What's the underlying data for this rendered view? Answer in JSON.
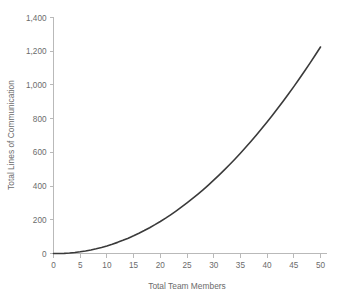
{
  "chart_data": {
    "type": "line",
    "title": "",
    "subtitle": "",
    "xlabel": "Total Team Members",
    "ylabel": "Total Lines of Communication",
    "xlim": [
      0,
      50
    ],
    "ylim": [
      0,
      1400
    ],
    "xticks": [
      0,
      5,
      10,
      15,
      20,
      25,
      30,
      35,
      40,
      45,
      50
    ],
    "xtick_labels": [
      "0",
      "5",
      "10",
      "15",
      "20",
      "25",
      "30",
      "35",
      "40",
      "45",
      "50"
    ],
    "yticks": [
      0,
      200,
      400,
      600,
      800,
      1000,
      1200,
      1400
    ],
    "ytick_labels": [
      "0",
      "200",
      "400",
      "600",
      "800",
      "1,000",
      "1,200",
      "1,400"
    ],
    "grid": false,
    "legend": false,
    "legend_position": "none",
    "annotations": [],
    "series": [
      {
        "name": "Lines of Communication",
        "formula": "n(n-1)/2",
        "color": "#3a3a3a",
        "x": [
          0,
          1,
          2,
          3,
          4,
          5,
          6,
          7,
          8,
          9,
          10,
          11,
          12,
          13,
          14,
          15,
          16,
          17,
          18,
          19,
          20,
          21,
          22,
          23,
          24,
          25,
          26,
          27,
          28,
          29,
          30,
          31,
          32,
          33,
          34,
          35,
          36,
          37,
          38,
          39,
          40,
          41,
          42,
          43,
          44,
          45,
          46,
          47,
          48,
          49,
          50
        ],
        "values": [
          0,
          0,
          1,
          3,
          6,
          10,
          15,
          21,
          28,
          36,
          45,
          55,
          66,
          78,
          91,
          105,
          120,
          136,
          153,
          171,
          190,
          210,
          231,
          253,
          276,
          300,
          325,
          351,
          378,
          406,
          435,
          465,
          496,
          528,
          561,
          595,
          630,
          666,
          703,
          741,
          780,
          820,
          861,
          903,
          946,
          990,
          1035,
          1081,
          1128,
          1176,
          1225
        ]
      }
    ]
  },
  "style": {
    "background_color": "#ffffff",
    "axis_color": "#b9b9b9",
    "text_color": "#6b6b6b",
    "curve_color": "#3a3a3a"
  }
}
